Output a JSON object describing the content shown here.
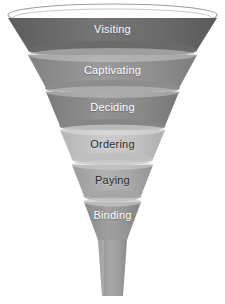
{
  "diagram": {
    "type": "funnel",
    "background_color": "#ffffff",
    "orientation": "vertical-tapering",
    "rim": {
      "name": "funnel-top-rim",
      "fill_color": "#ffffff",
      "stroke_color": "#9a9a9a"
    },
    "spout": {
      "name": "funnel-spout",
      "fill_color": "#9e9e9e",
      "top_width": 28,
      "bottom_width": 20
    },
    "stages": [
      {
        "label": "Visiting",
        "color": "#6e6e6e",
        "highlight_color": "#8d8d8d",
        "text_color": "#ffffff",
        "text_style": "light",
        "order": 1,
        "top_half_width": 104,
        "bottom_half_width": 84,
        "y_top": 18,
        "y_bottom": 50,
        "label_y": 23
      },
      {
        "label": "Captivating",
        "color": "#919191",
        "highlight_color": "#b4b4b4",
        "text_color": "#ffffff",
        "text_style": "light",
        "order": 2,
        "top_half_width": 84,
        "bottom_half_width": 67,
        "y_top": 55,
        "y_bottom": 88,
        "label_y": 64
      },
      {
        "label": "Deciding",
        "color": "#8a8a8a",
        "highlight_color": "#adadad",
        "text_color": "#ffffff",
        "text_style": "light",
        "order": 3,
        "top_half_width": 67,
        "bottom_half_width": 53,
        "y_top": 92,
        "y_bottom": 126,
        "label_y": 101
      },
      {
        "label": "Ordering",
        "color": "#c3c3c3",
        "highlight_color": "#dcdcdc",
        "text_color": "#2a2a2a",
        "text_style": "dark",
        "order": 4,
        "top_half_width": 53,
        "bottom_half_width": 41,
        "y_top": 130,
        "y_bottom": 159,
        "label_y": 138
      },
      {
        "label": "Paying",
        "color": "#a9a9a9",
        "highlight_color": "#c8c8c8",
        "text_color": "#2a2a2a",
        "text_style": "dark",
        "order": 5,
        "top_half_width": 41,
        "bottom_half_width": 29,
        "y_top": 165,
        "y_bottom": 196,
        "label_y": 174
      },
      {
        "label": "Binding",
        "color": "#979797",
        "highlight_color": "#bdbdbd",
        "text_color": "#ffffff",
        "text_style": "light",
        "order": 6,
        "top_half_width": 29,
        "bottom_half_width": 15,
        "y_top": 202,
        "y_bottom": 240,
        "label_y": 209
      }
    ]
  }
}
